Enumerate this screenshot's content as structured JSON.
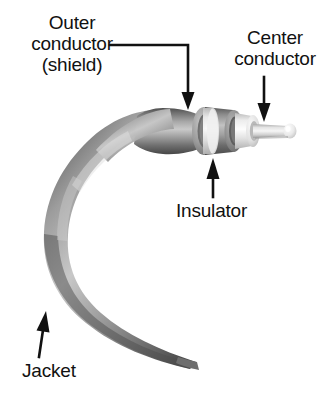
{
  "figure": {
    "background_color": "#ffffff",
    "ink_color": "#111111",
    "width": 332,
    "height": 400
  },
  "labels": {
    "outer_conductor": "Outer\nconductor\n(shield)",
    "center_conductor": "Center\nconductor",
    "insulator": "Insulator",
    "jacket": "Jacket"
  },
  "layers": [
    {
      "name": "jacket",
      "label": "Jacket",
      "order": 1,
      "color": "#8a8a8a",
      "highlight": "#cfcfcf",
      "shadow": "#4a4a4a"
    },
    {
      "name": "outer-conductor-shield",
      "label": "Outer conductor (shield)",
      "order": 2,
      "color": "#9a9a9a",
      "highlight": "#c6c6c6",
      "shadow": "#5c5c5c"
    },
    {
      "name": "insulator",
      "label": "Insulator",
      "order": 3,
      "color": "#e8e8e8",
      "highlight": "#fbfbfb",
      "shadow": "#bdbdbd"
    },
    {
      "name": "center-conductor",
      "label": "Center conductor",
      "order": 4,
      "color": "#d8d8d8",
      "highlight": "#f4f4f4",
      "shadow": "#9b9b9b"
    }
  ],
  "arrows": [
    {
      "name": "outer-conductor-arrow",
      "target": "outer-conductor-shield",
      "style": "elbow",
      "direction": "down"
    },
    {
      "name": "center-conductor-arrow",
      "target": "center-conductor",
      "style": "straight",
      "direction": "down"
    },
    {
      "name": "insulator-arrow",
      "target": "insulator",
      "style": "straight",
      "direction": "up"
    },
    {
      "name": "jacket-arrow",
      "target": "jacket",
      "style": "straight",
      "direction": "up"
    }
  ]
}
